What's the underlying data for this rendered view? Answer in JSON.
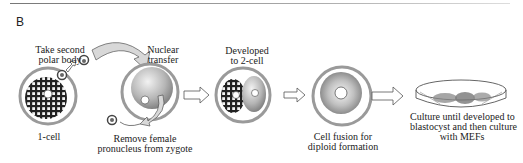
{
  "panel_label": "B",
  "steps": [
    {
      "id": "one-cell",
      "label": "1-cell"
    },
    {
      "id": "take-polar-body",
      "label_line1": "Take second",
      "label_line2": "polar body"
    },
    {
      "id": "nuclear-transfer",
      "label_line1": "Nuclear",
      "label_line2": "transfer"
    },
    {
      "id": "remove-pronucleus",
      "label_line1": "Remove female",
      "label_line2": "pronucleus from zygote"
    },
    {
      "id": "two-cell",
      "label_line1": "Developed",
      "label_line2": "to 2-cell"
    },
    {
      "id": "cell-fusion",
      "label_line1": "Cell fusion for",
      "label_line2": "diploid formation"
    },
    {
      "id": "culture",
      "label_line1": "Culture until developed to",
      "label_line2": "blastocyst and then culture",
      "label_line3": "with MEFs"
    }
  ],
  "colors": {
    "ring": "#9a9a9a",
    "cell_light": "#f0f0f0",
    "cell_dark": "#8a8a8a",
    "line": "#333333"
  }
}
